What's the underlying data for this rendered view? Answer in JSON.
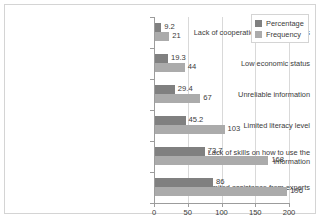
{
  "chart_data": {
    "type": "bar",
    "orientation": "horizontal",
    "title": "",
    "xlabel": "",
    "ylabel": "",
    "xlim": [
      0,
      200
    ],
    "xticks": [
      0,
      50,
      100,
      150,
      200
    ],
    "grid": true,
    "legend_position": "top-right",
    "categories": [
      "Lack of cooperation among farmers",
      "Low economic status",
      "Unreliable information",
      "Limited literacy level",
      "Lack of skills on how to use the information",
      "Limited assistance from experts"
    ],
    "series": [
      {
        "name": "Percentage",
        "color": "#808080",
        "values": [
          9.2,
          19.3,
          29.4,
          45.2,
          73.7,
          86
        ],
        "labels": [
          "9.2",
          "19.3",
          "29.4",
          "45.2",
          "73.7",
          "86"
        ]
      },
      {
        "name": "Frequency",
        "color": "#ababab",
        "values": [
          21,
          44,
          67,
          103,
          168,
          196
        ],
        "labels": [
          "21",
          "44",
          "67",
          "103",
          "168",
          "196"
        ]
      }
    ]
  }
}
